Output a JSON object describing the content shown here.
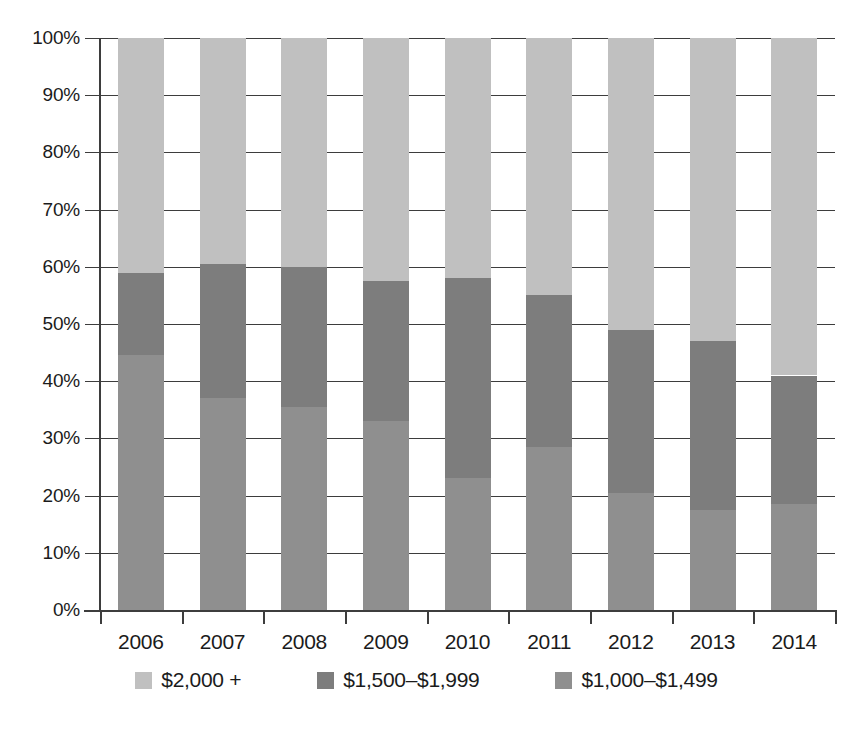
{
  "chart_data": {
    "type": "bar",
    "stacked": true,
    "normalized_percent": true,
    "title": "",
    "xlabel": "",
    "ylabel": "",
    "categories": [
      "2006",
      "2007",
      "2008",
      "2009",
      "2010",
      "2011",
      "2012",
      "2013",
      "2014"
    ],
    "ylim": [
      0,
      100
    ],
    "ytick_labels": [
      "0%",
      "10%",
      "20%",
      "30%",
      "40%",
      "50%",
      "60%",
      "70%",
      "80%",
      "90%",
      "100%"
    ],
    "ytick_values": [
      0,
      10,
      20,
      30,
      40,
      50,
      60,
      70,
      80,
      90,
      100
    ],
    "grid": true,
    "grid_axis": "y",
    "legend_position": "bottom",
    "series": [
      {
        "name": "$1,000–$1,499",
        "color": "#8f8f8f",
        "values": [
          44.5,
          37.0,
          35.5,
          33.0,
          23.0,
          28.5,
          20.5,
          17.5,
          18.5
        ]
      },
      {
        "name": "$1,500–$1,999",
        "color": "#7d7d7d",
        "values": [
          14.5,
          23.5,
          24.5,
          24.5,
          35.0,
          26.5,
          28.5,
          29.5,
          22.5
        ]
      },
      {
        "name": "$2,000 +",
        "color": "#c0c0c0",
        "values": [
          41.0,
          39.5,
          40.0,
          42.5,
          42.0,
          45.0,
          51.0,
          53.0,
          59.0
        ]
      }
    ],
    "cumulative_tops": {
      "$1,000–$1,499": [
        44.5,
        37.0,
        35.5,
        33.0,
        23.0,
        28.5,
        20.5,
        17.5,
        18.5
      ],
      "$1,500–$1,999": [
        59.0,
        60.5,
        60.0,
        57.5,
        58.0,
        55.0,
        49.0,
        47.0,
        41.0
      ],
      "$2,000 +": [
        100,
        100,
        100,
        100,
        100,
        100,
        100,
        100,
        100
      ]
    }
  },
  "legend": {
    "items": [
      {
        "label": "$2,000 +",
        "color": "#c0c0c0"
      },
      {
        "label": "$1,500–$1,999",
        "color": "#7d7d7d"
      },
      {
        "label": "$1,000–$1,499",
        "color": "#8f8f8f"
      }
    ]
  },
  "colors": {
    "axis": "#3d3d3d",
    "text": "#1b1b1b",
    "background": "#ffffff"
  }
}
